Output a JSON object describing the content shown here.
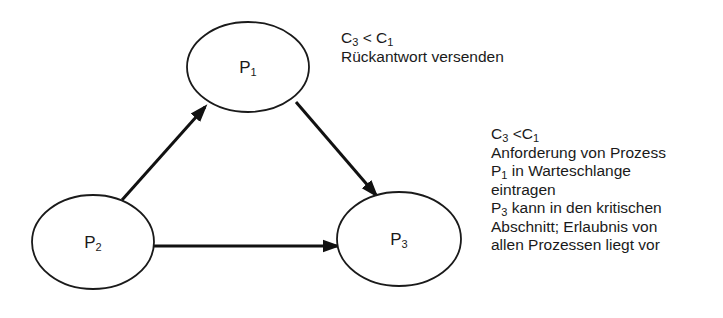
{
  "diagram": {
    "nodes": [
      {
        "id": "P1",
        "base": "P",
        "sub": "1",
        "cx": 248,
        "cy": 67,
        "rx": 61,
        "ry": 45
      },
      {
        "id": "P2",
        "base": "P",
        "sub": "2",
        "cx": 93,
        "cy": 242,
        "rx": 61,
        "ry": 47
      },
      {
        "id": "P3",
        "base": "P",
        "sub": "3",
        "cx": 399,
        "cy": 239,
        "rx": 62,
        "ry": 47
      }
    ],
    "edges": [
      {
        "from": "P2",
        "to": "P1",
        "x1": 122,
        "y1": 200,
        "x2": 205,
        "y2": 107
      },
      {
        "from": "P1",
        "to": "P3",
        "x1": 296,
        "y1": 102,
        "x2": 376,
        "y2": 195
      },
      {
        "from": "P2",
        "to": "P3",
        "x1": 154,
        "y1": 246,
        "x2": 337,
        "y2": 246
      }
    ],
    "annotations": {
      "p1_note": {
        "condition": {
          "a": "C",
          "a_sub": "3",
          "op": " < ",
          "b": "C",
          "b_sub": "1"
        },
        "lines": [
          "Rückantwort versenden"
        ]
      },
      "p3_note": {
        "condition": {
          "a": "C",
          "a_sub": "3",
          "op": " <",
          "b": "C",
          "b_sub": "1"
        },
        "line1": "Anforderung von Prozess",
        "line2_prefix": "P",
        "line2_sub": "1",
        "line2_rest": " in Warteschlange",
        "line3": "eintragen",
        "line4_prefix": "P",
        "line4_sub": "3",
        "line4_rest": " kann in den kritischen",
        "line5": "Abschnitt; Erlaubnis von",
        "line6": "allen Prozessen liegt vor"
      }
    },
    "colors": {
      "stroke": "#1a1a1a",
      "background": "#ffffff"
    }
  }
}
